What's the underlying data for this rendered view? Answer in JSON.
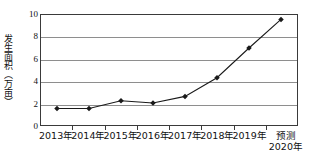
{
  "chart_data": {
    "type": "line",
    "title": "",
    "xlabel": "",
    "ylabel": "发生面积（万亩）",
    "categories": [
      "2013年",
      "2014年",
      "2015年",
      "2016年",
      "2017年",
      "2018年",
      "2019年",
      "预测2020年"
    ],
    "category_lines": [
      [
        "2013年"
      ],
      [
        "2014年"
      ],
      [
        "2015年"
      ],
      [
        "2016年"
      ],
      [
        "2017年"
      ],
      [
        "2018年"
      ],
      [
        "2019年"
      ],
      [
        "预测",
        "2020年"
      ]
    ],
    "values": [
      1.5,
      1.5,
      2.2,
      2.0,
      2.6,
      4.3,
      7.0,
      9.6
    ],
    "ylim": [
      0,
      10
    ],
    "yticks": [
      0,
      2,
      4,
      6,
      8,
      10
    ],
    "ytick_labels": [
      "0",
      "2",
      "4",
      "6",
      "8",
      "10"
    ],
    "grid": true,
    "legend": "none",
    "marker": "diamond",
    "series_color": "#1a1a1a",
    "grid_color": "#8e8e8e",
    "axis_color": "#3a3a3a",
    "background": "#ffffff"
  }
}
